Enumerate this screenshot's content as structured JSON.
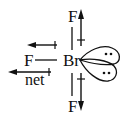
{
  "diagram": {
    "molecule": "BrF3",
    "center_atom": "Br",
    "atoms": [
      {
        "label": "F",
        "position": "top"
      },
      {
        "label": "F",
        "position": "left"
      },
      {
        "label": "F",
        "position": "bottom"
      }
    ],
    "lone_pairs": 2,
    "net_label": "net",
    "colors": {
      "ink": "#111111",
      "background": "#ffffff"
    }
  }
}
